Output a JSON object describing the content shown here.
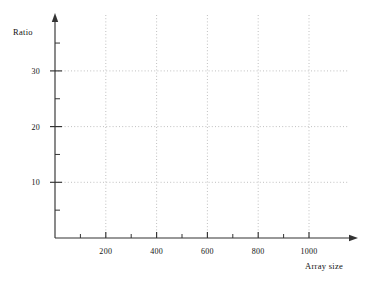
{
  "figure": {
    "background_color": "#ffffff",
    "axis_color": "#333333",
    "grid_color": "#b9b9b9",
    "text_color": "#111111"
  },
  "chart_data": {
    "type": "line",
    "title": "",
    "subtitle": "",
    "xlabel": "Array size",
    "ylabel": "Ratio",
    "xlim": [
      0,
      1100
    ],
    "ylim": [
      0,
      38
    ],
    "grid": true,
    "grid_style": "dotted",
    "legend": null,
    "legend_position": "none",
    "series": [],
    "values": [],
    "x": [],
    "categories": [],
    "annotations": [],
    "note": "Empty axes: no data series are plotted in the figure.",
    "x_major_ticks": [
      200,
      400,
      600,
      800,
      1000
    ],
    "x_minor_ticks": [
      100,
      300,
      500,
      700,
      900
    ],
    "x_tick_labels": [
      "200",
      "400",
      "600",
      "800",
      "1000"
    ],
    "y_major_ticks": [
      10,
      20,
      30
    ],
    "y_minor_ticks": [
      5,
      15,
      25,
      35
    ],
    "y_tick_labels": [
      "10",
      "20",
      "30"
    ],
    "axis_arrows": true
  }
}
